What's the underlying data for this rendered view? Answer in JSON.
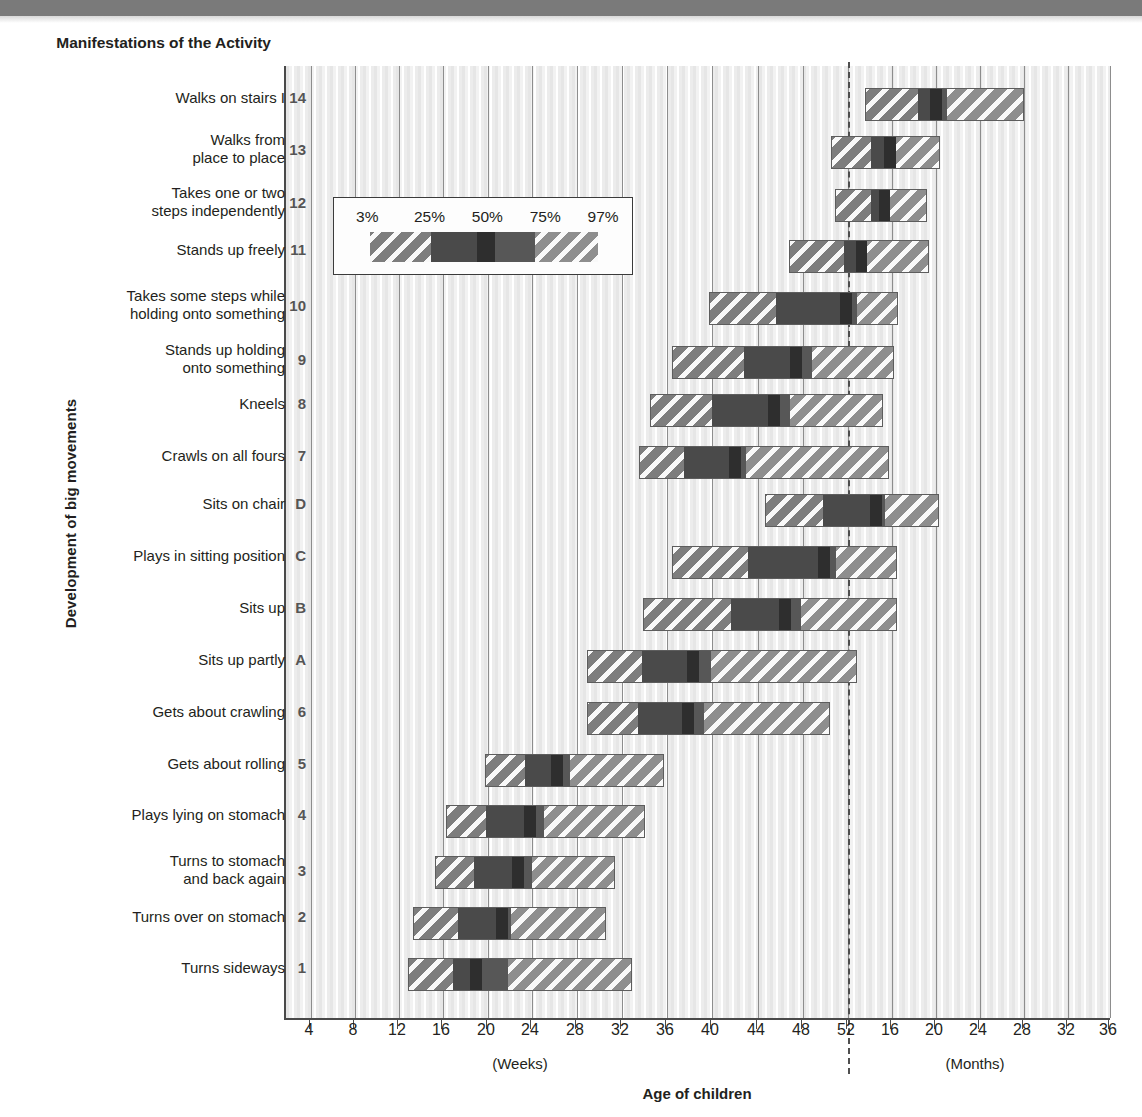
{
  "header": {
    "column_title": "Manifestations of\nthe Activity"
  },
  "axes": {
    "y_title": "Development of big movements",
    "x_title": "Age of children",
    "weeks_label": "(Weeks)",
    "months_label": "(Months)",
    "week_ticks": [
      4,
      8,
      12,
      16,
      20,
      24,
      28,
      32,
      36,
      40,
      44,
      48,
      52
    ],
    "month_ticks": [
      16,
      20,
      24,
      28,
      32,
      36
    ],
    "divider_weeks": 52
  },
  "legend": {
    "ticks": [
      "3%",
      "25%",
      "50%",
      "75%",
      "97%"
    ],
    "segments": [
      "p3-25",
      "p25-50",
      "p50",
      "p50-75",
      "p75-97"
    ]
  },
  "chart_data": {
    "type": "bar",
    "title": "Development of big movements",
    "xlabel": "Age of children",
    "ylabel": "Manifestations of the Activity",
    "x_unit_primary": "weeks",
    "x_unit_secondary": "months",
    "x_breakpoint_weeks": 52,
    "percentiles": [
      "3%",
      "25%",
      "50%",
      "75%",
      "97%"
    ],
    "grid": true,
    "legend_position": "inside-upper-left",
    "categories": [
      {
        "code": "14",
        "label": "Walks on stairs I",
        "p3": 17.0,
        "p25": 19.1,
        "p50": 20.4,
        "p75": 22.2,
        "p97": 26.1,
        "unit": "months"
      },
      {
        "code": "13",
        "label": "Walks from\nplace to place",
        "p3": 12.5,
        "p25": 14.6,
        "p50": 15.8,
        "p75": 17.0,
        "p97": 20.7,
        "unit": "months"
      },
      {
        "code": "12",
        "label": "Takes one or two\nsteps independently",
        "p3": 12.6,
        "p25": 14.5,
        "p50": 15.2,
        "p75": 16.1,
        "p97": 20.0,
        "unit": "months"
      },
      {
        "code": "11",
        "label": "Stands up freely",
        "p3": 46.0,
        "p25": 52.5,
        "p50": 56.5,
        "p75": 60.0,
        "p97": 74.0,
        "unit": "weeks-scale"
      },
      {
        "code": "10",
        "label": "Takes some steps while\nholding onto something",
        "p3": 37.5,
        "p25": 44.0,
        "p50": 51.5,
        "p75": 53.5,
        "p97": 57.0,
        "unit": "weeks"
      },
      {
        "code": "9",
        "label": "Stands up holding\nonto something",
        "p3": 34.0,
        "p25": 41.5,
        "p50": 46.5,
        "p75": 50.5,
        "p97": 56.0,
        "unit": "weeks"
      },
      {
        "code": "8",
        "label": "Kneels",
        "p3": 32.0,
        "p25": 37.5,
        "p50": 44.5,
        "p75": 47.5,
        "p97": 54.5,
        "unit": "weeks"
      },
      {
        "code": "7",
        "label": "Crawls on all fours",
        "p3": 30.0,
        "p25": 34.5,
        "p50": 38.5,
        "p75": 43.5,
        "p97": 52.5,
        "unit": "weeks"
      },
      {
        "code": "D",
        "label": "Sits on chair",
        "p3": 42.5,
        "p25": 49.5,
        "p50": 54.0,
        "p75": 56.0,
        "p97": 61.0,
        "unit": "weeks-scale"
      },
      {
        "code": "C",
        "label": "Plays in sitting position",
        "p3": 35.5,
        "p25": 43.0,
        "p50": 50.0,
        "p75": 52.5,
        "p97": 57.0,
        "unit": "weeks"
      },
      {
        "code": "B",
        "label": "Sits up",
        "p3": 31.5,
        "p25": 40.5,
        "p50": 45.5,
        "p75": 50.0,
        "p97": 57.0,
        "unit": "weeks"
      },
      {
        "code": "A",
        "label": "Sits up partly",
        "p3": 26.0,
        "p25": 31.0,
        "p50": 35.5,
        "p75": 41.0,
        "p97": 54.0,
        "unit": "weeks"
      },
      {
        "code": "6",
        "label": "Gets about crawling",
        "p3": 26.0,
        "p25": 30.5,
        "p50": 35.0,
        "p75": 40.0,
        "p97": 50.5,
        "unit": "weeks"
      },
      {
        "code": "5",
        "label": "Gets about rolling",
        "p3": 22.0,
        "p25": 25.5,
        "p50": 28.0,
        "p75": 30.0,
        "p97": 38.5,
        "unit": "weeks"
      },
      {
        "code": "4",
        "label": "Plays lying on stomach",
        "p3": 18.5,
        "p25": 22.0,
        "p50": 25.5,
        "p75": 27.5,
        "p97": 36.5,
        "unit": "weeks"
      },
      {
        "code": "3",
        "label": "Turns to stomach\nand back again",
        "p3": 17.5,
        "p25": 21.0,
        "p50": 24.5,
        "p75": 27.5,
        "p97": 35.0,
        "unit": "weeks"
      },
      {
        "code": "2",
        "label": "Turns over on stomach",
        "p3": 15.5,
        "p25": 19.5,
        "p50": 23.0,
        "p75": 24.5,
        "p97": 33.0,
        "unit": "weeks"
      },
      {
        "code": "1",
        "label": "Turns sideways",
        "p3": 13.2,
        "p25": 17.2,
        "p50": 18.8,
        "p75": 22.2,
        "p97": 31.2,
        "unit": "weeks"
      }
    ]
  },
  "bars_px": [
    {
      "code": "14",
      "start": 865,
      "s25": 918,
      "s50": 930,
      "s75": 947,
      "end": 1024
    },
    {
      "code": "13",
      "start": 831,
      "s25": 871,
      "s50": 884,
      "s75": 896,
      "end": 940
    },
    {
      "code": "12",
      "start": 835,
      "s25": 872,
      "s50": 880,
      "s75": 889,
      "end": 927
    },
    {
      "code": "11",
      "start": 789,
      "s25": 844,
      "s50": 856,
      "s75": 867,
      "end": 929
    },
    {
      "code": "10",
      "start": 709,
      "s25": 776,
      "s50": 840,
      "s75": 858,
      "end": 898
    },
    {
      "code": "9",
      "start": 672,
      "s25": 744,
      "s50": 790,
      "s75": 812,
      "end": 894
    },
    {
      "code": "8",
      "start": 650,
      "s25": 712,
      "s50": 768,
      "s75": 790,
      "end": 883
    },
    {
      "code": "7",
      "start": 639,
      "s25": 683,
      "s50": 729,
      "s75": 746,
      "end": 889
    },
    {
      "code": "D",
      "start": 765,
      "s25": 823,
      "s50": 870,
      "s75": 885,
      "end": 939
    },
    {
      "code": "C",
      "start": 672,
      "s25": 748,
      "s50": 818,
      "s75": 836,
      "end": 897
    },
    {
      "code": "B",
      "start": 643,
      "s25": 731,
      "s50": 779,
      "s75": 801,
      "end": 897
    },
    {
      "code": "A",
      "start": 587,
      "s25": 641,
      "s50": 687,
      "s75": 711,
      "end": 857
    },
    {
      "code": "6",
      "start": 587,
      "s25": 637,
      "s50": 682,
      "s75": 704,
      "end": 830
    },
    {
      "code": "5",
      "start": 485,
      "s25": 524,
      "s50": 551,
      "s75": 570,
      "end": 664
    },
    {
      "code": "4",
      "start": 446,
      "s25": 485,
      "s50": 524,
      "s75": 544,
      "end": 645
    },
    {
      "code": "3",
      "start": 435,
      "s25": 473,
      "s50": 512,
      "s75": 532,
      "end": 615
    },
    {
      "code": "2",
      "start": 413,
      "s25": 457,
      "s50": 496,
      "s75": 511,
      "end": 606
    },
    {
      "code": "1",
      "start": 408,
      "s25": 452,
      "s50": 470,
      "s75": 508,
      "end": 632
    }
  ],
  "row_tops": [
    88,
    136,
    189,
    240,
    292,
    346,
    394,
    446,
    494,
    546,
    598,
    650,
    702,
    754,
    805,
    856,
    907,
    958
  ],
  "label_tops": [
    89,
    131,
    184,
    241,
    287,
    341,
    395,
    447,
    495,
    547,
    599,
    651,
    703,
    755,
    806,
    852,
    908,
    959
  ],
  "xticks_px": [
    {
      "label": "4",
      "x": 309
    },
    {
      "label": "8",
      "x": 353
    },
    {
      "label": "12",
      "x": 397
    },
    {
      "label": "16",
      "x": 441
    },
    {
      "label": "20",
      "x": 486
    },
    {
      "label": "24",
      "x": 530
    },
    {
      "label": "28",
      "x": 575
    },
    {
      "label": "32",
      "x": 620
    },
    {
      "label": "36",
      "x": 665
    },
    {
      "label": "40",
      "x": 710
    },
    {
      "label": "44",
      "x": 756
    },
    {
      "label": "48",
      "x": 801
    },
    {
      "label": "52",
      "x": 846
    },
    {
      "label": "16",
      "x": 890
    },
    {
      "label": "20",
      "x": 934
    },
    {
      "label": "24",
      "x": 978
    },
    {
      "label": "28",
      "x": 1022
    },
    {
      "label": "32",
      "x": 1066
    },
    {
      "label": "36",
      "x": 1108
    }
  ]
}
